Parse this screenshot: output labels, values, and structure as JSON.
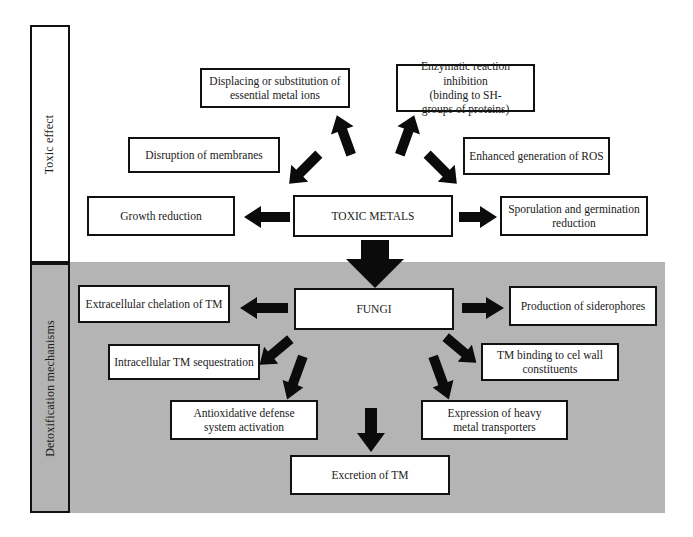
{
  "figure": {
    "type": "flow-diagram",
    "sections": [
      {
        "id": "toxic",
        "label": "Toxic effect",
        "background": "#ffffff"
      },
      {
        "id": "detox",
        "label": "Detoxification mechanisms",
        "background": "#b4b4b4"
      }
    ],
    "colors": {
      "panel_gray": "#b4b4b4",
      "box_fill": "#ffffff",
      "box_stroke": "#111111",
      "arrow_fill": "#0b0b0b",
      "text": "#1a1a1a"
    }
  },
  "toxic_section": {
    "label": "Toxic effect",
    "hub": {
      "label": "TOXIC METALS"
    },
    "nodes": [
      {
        "id": "displacing",
        "label": "Displacing or substitution of essential metal ions"
      },
      {
        "id": "enzymatic",
        "label": "Enzymatic reaction inhibition (binding to SH- groups of proteins)"
      },
      {
        "id": "membranes",
        "label": "Disruption of membranes"
      },
      {
        "id": "ros",
        "label": "Enhanced generation of ROS"
      },
      {
        "id": "growth",
        "label": "Growth reduction"
      },
      {
        "id": "sporulation",
        "label": "Sporulation and germination reduction"
      }
    ],
    "node_lines": {
      "displacing": [
        "Displacing or substitution of",
        "essential metal ions"
      ],
      "enzymatic": [
        "Enzymatic reaction inhibition",
        "(binding to SH-",
        "groups of proteins)"
      ],
      "membranes": [
        "Disruption of membranes"
      ],
      "ros": [
        "Enhanced generation of ROS"
      ],
      "growth": [
        "Growth reduction"
      ],
      "sporulation": [
        "Sporulation and germination",
        "reduction"
      ]
    }
  },
  "detox_section": {
    "label": "Detoxification mechanisms",
    "hub": {
      "label": "FUNGI"
    },
    "nodes": [
      {
        "id": "extracellular",
        "label": "Extracellular chelation of TM"
      },
      {
        "id": "siderophores",
        "label": "Production of siderophores"
      },
      {
        "id": "intracellular",
        "label": "Intracellular TM sequestration"
      },
      {
        "id": "cellwall",
        "label": "TM binding to cel wall constituents"
      },
      {
        "id": "antioxidative",
        "label": "Antioxidative defense system activation"
      },
      {
        "id": "transporters",
        "label": "Expression of heavy metal transporters"
      },
      {
        "id": "excretion",
        "label": "Excretion of TM"
      }
    ],
    "node_lines": {
      "extracellular": [
        "Extracellular chelation of TM"
      ],
      "siderophores": [
        "Production of siderophores"
      ],
      "intracellular": [
        "Intracellular TM sequestration"
      ],
      "cellwall": [
        "TM binding to cel wall",
        "constituents"
      ],
      "antioxidative": [
        "Antioxidative defense",
        "system activation"
      ],
      "transporters": [
        "Expression of heavy",
        "metal transporters"
      ],
      "excretion": [
        "Excretion of TM"
      ]
    }
  },
  "arrows": [
    {
      "id": "toxic-to-growth",
      "from": "TOXIC METALS",
      "to": "Growth reduction",
      "direction": "left"
    },
    {
      "id": "toxic-to-sporulation",
      "from": "TOXIC METALS",
      "to": "Sporulation and germination reduction",
      "direction": "right"
    },
    {
      "id": "toxic-to-membranes",
      "from": "TOXIC METALS",
      "to": "Disruption of membranes",
      "direction": "up-left"
    },
    {
      "id": "toxic-to-ros",
      "from": "TOXIC METALS",
      "to": "Enhanced generation of ROS",
      "direction": "up-right"
    },
    {
      "id": "toxic-to-displacing",
      "from": "TOXIC METALS",
      "to": "Displacing or substitution of essential metal ions",
      "direction": "up-left"
    },
    {
      "id": "toxic-to-enzymatic",
      "from": "TOXIC METALS",
      "to": "Enzymatic reaction inhibition",
      "direction": "up-right"
    },
    {
      "id": "toxic-to-fungi",
      "from": "TOXIC METALS",
      "to": "FUNGI",
      "direction": "down"
    },
    {
      "id": "fungi-to-extracellular",
      "from": "FUNGI",
      "to": "Extracellular chelation of TM",
      "direction": "left"
    },
    {
      "id": "fungi-to-siderophores",
      "from": "FUNGI",
      "to": "Production of siderophores",
      "direction": "right"
    },
    {
      "id": "fungi-to-intracellular",
      "from": "FUNGI",
      "to": "Intracellular TM sequestration",
      "direction": "down-left"
    },
    {
      "id": "fungi-to-cellwall",
      "from": "FUNGI",
      "to": "TM binding to cel wall constituents",
      "direction": "down-right"
    },
    {
      "id": "fungi-to-antioxidative",
      "from": "FUNGI",
      "to": "Antioxidative defense system activation",
      "direction": "down-left"
    },
    {
      "id": "fungi-to-transporters",
      "from": "FUNGI",
      "to": "Expression of heavy metal transporters",
      "direction": "down-right"
    },
    {
      "id": "fungi-to-excretion",
      "from": "FUNGI",
      "to": "Excretion of TM",
      "direction": "down"
    }
  ]
}
